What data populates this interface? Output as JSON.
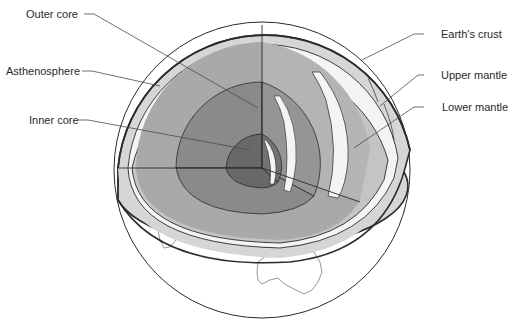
{
  "diagram": {
    "type": "earth-cutaway",
    "labels": {
      "outer_core": "Outer core",
      "asthenosphere": "Asthenosphere",
      "inner_core": "Inner core",
      "earths_crust": "Earth's crust",
      "upper_mantle": "Upper mantle",
      "lower_mantle": "Lower mantle"
    },
    "colors": {
      "background": "#ffffff",
      "outline": "#2b2b2b",
      "crust": "#d6d6d6",
      "upper_mantle": "#c4c4c4",
      "lower_mantle": "#a9a9a9",
      "outer_core": "#8a8a8a",
      "inner_core": "#686868",
      "highlight": "#f4f4f4",
      "leader_line": "#4a4a4a"
    },
    "visible_continent": "Australia"
  }
}
